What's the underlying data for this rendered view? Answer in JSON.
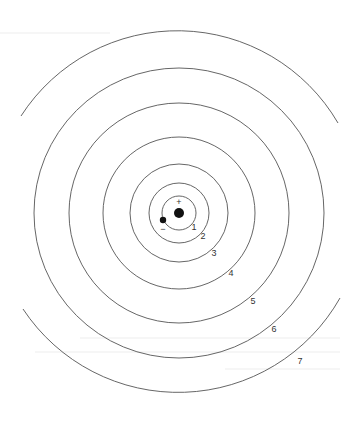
{
  "diagram": {
    "type": "bohr-atom-energy-levels",
    "center": {
      "x": 179,
      "y": 213
    },
    "nucleus": {
      "sign": "+",
      "radius": 5,
      "color": "#111111"
    },
    "electron": {
      "sign": "−",
      "x": 163,
      "y": 220,
      "radius": 3,
      "color": "#111111"
    },
    "line_color": "#555555",
    "orbits": [
      {
        "n": "1",
        "radius": 17,
        "label_x": 194,
        "label_y": 230
      },
      {
        "n": "2",
        "radius": 30,
        "label_x": 203,
        "label_y": 239
      },
      {
        "n": "3",
        "radius": 49,
        "label_x": 214,
        "label_y": 256
      },
      {
        "n": "4",
        "radius": 76,
        "label_x": 231,
        "label_y": 276
      },
      {
        "n": "5",
        "radius": 110,
        "label_x": 253,
        "label_y": 304
      },
      {
        "n": "6",
        "radius": 145,
        "label_x": 274,
        "label_y": 332
      },
      {
        "n": "7",
        "radius": 186,
        "label_x": 300,
        "label_y": 364
      }
    ]
  }
}
